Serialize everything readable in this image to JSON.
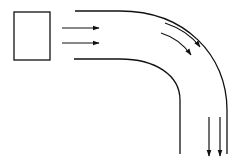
{
  "diagram": {
    "colors": {
      "stroke": "#111111",
      "background": "#ffffff"
    },
    "elements": {
      "source_box": {
        "x": 14,
        "y": 12,
        "width": 36,
        "height": 48
      },
      "inlet_arrows": [
        {
          "x1": 62,
          "y1": 28,
          "x2": 99,
          "y2": 28
        },
        {
          "x1": 62,
          "y1": 43,
          "x2": 99,
          "y2": 43
        }
      ],
      "channel_outer_wall": "M75 11 L120 11 C185 11 227 55 227 110 L227 154",
      "channel_inner_wall": "M74 59 L120 59 C155 59 180 75 180 100 L180 154",
      "bend_arrows": [
        "M165 23 C180 28 192 36 200 47",
        "M161 33 C174 37 184 45 191 55"
      ],
      "outlet_arrows": [
        {
          "x1": 209,
          "y1": 117,
          "x2": 209,
          "y2": 156
        },
        {
          "x1": 220,
          "y1": 117,
          "x2": 220,
          "y2": 156
        }
      ]
    }
  }
}
